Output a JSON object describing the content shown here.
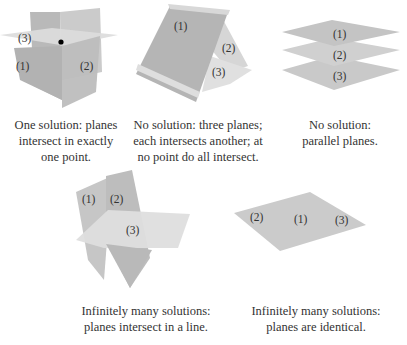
{
  "figure": {
    "panels": [
      {
        "id": "one-solution",
        "plane_labels": [
          "(1)",
          "(2)",
          "(3)"
        ],
        "caption_lines": [
          "One solution: planes",
          "intersect in exactly",
          "one point."
        ],
        "marker": "intersection-point"
      },
      {
        "id": "no-solution-pairwise",
        "plane_labels": [
          "(1)",
          "(2)",
          "(3)"
        ],
        "caption_lines": [
          "No solution: three planes;",
          "each intersects another; at",
          "no point do all intersect."
        ]
      },
      {
        "id": "no-solution-parallel",
        "plane_labels": [
          "(1)",
          "(2)",
          "(3)"
        ],
        "caption_lines": [
          "No solution:",
          "parallel planes."
        ]
      },
      {
        "id": "infinite-line",
        "plane_labels": [
          "(1)",
          "(2)",
          "(3)"
        ],
        "caption_lines": [
          "Infinitely many solutions:",
          "planes intersect in a line."
        ]
      },
      {
        "id": "infinite-identical",
        "plane_labels": [
          "(2)",
          "(1)",
          "(3)"
        ],
        "caption_lines": [
          "Infinitely many solutions:",
          "planes are identical."
        ]
      }
    ],
    "colors": {
      "plane_dark": "#b4b4b4",
      "plane_mid": "#c6c6c6",
      "plane_light": "#dadada",
      "plane_edge": "#e9e9e9",
      "point": "#000000",
      "text": "#333333"
    }
  }
}
